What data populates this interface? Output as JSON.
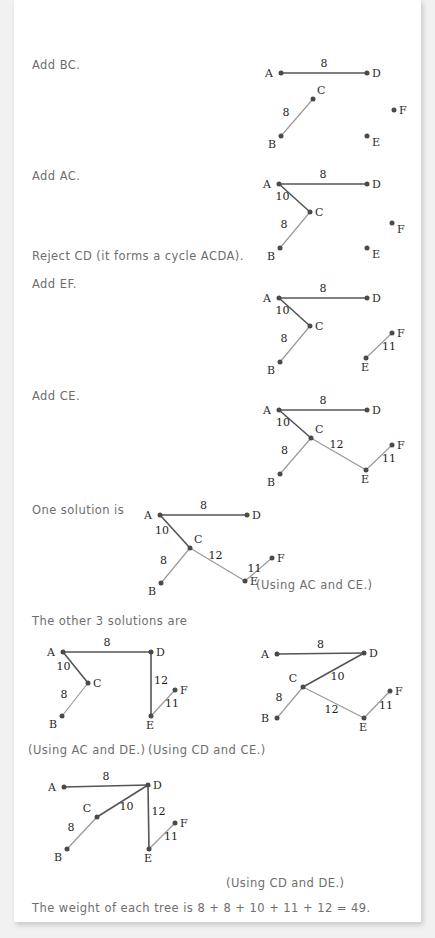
{
  "document": {
    "background_color": "#f1f1f1",
    "page_color": "#ffffff",
    "text_color": "#6e6e6e",
    "edge_dark_color": "#555555",
    "edge_light_color": "#9a9a9a",
    "node_color": "#4a4a4a"
  },
  "steps": [
    {
      "id": "step-add-bc",
      "text": "Add BC."
    },
    {
      "id": "step-add-ac",
      "text": "Add AC."
    },
    {
      "id": "step-reject-cd",
      "text": "Reject CD (it forms a cycle ACDA)."
    },
    {
      "id": "step-add-ef",
      "text": "Add EF."
    },
    {
      "id": "step-add-ce",
      "text": "Add CE."
    },
    {
      "id": "step-one-solution",
      "text": "One solution is"
    },
    {
      "id": "step-other-solutions",
      "text": "The other 3 solutions are"
    }
  ],
  "captions": [
    {
      "id": "caption-ac-ce",
      "text": "(Using AC and CE.)"
    },
    {
      "id": "caption-ac-de",
      "text": "(Using AC and DE.)"
    },
    {
      "id": "caption-cd-ce",
      "text": "(Using CD and CE.)"
    },
    {
      "id": "caption-cd-de",
      "text": "(Using CD and DE.)"
    }
  ],
  "conclusion": {
    "id": "weight-sentence",
    "text": "The weight of each tree is 8 + 8 + 10 + 11 + 12 = 49."
  },
  "chart_data": {
    "type": "diagram",
    "vertices": [
      "A",
      "B",
      "C",
      "D",
      "E",
      "F"
    ],
    "edge_weights": {
      "AD": 8,
      "BC": 8,
      "AC": 10,
      "CD": 10,
      "EF": 11,
      "CE": 12,
      "DE": 12
    },
    "total_weight": 49,
    "weight_terms": [
      8,
      8,
      10,
      11,
      12
    ],
    "figures": [
      {
        "name": "figure-add-bc",
        "caption": "Add BC.",
        "nodes": {
          "A": [
            281,
            73
          ],
          "D": [
            367,
            73
          ],
          "C": [
            313,
            99
          ],
          "B": [
            281,
            136
          ],
          "F": [
            394,
            110
          ],
          "E": [
            367,
            136
          ]
        },
        "label_pos": {
          "A": "left",
          "D": "right",
          "C": "above-right",
          "B": "below-left",
          "F": "right",
          "E": "below-right"
        },
        "edges": [
          {
            "from": "A",
            "to": "D",
            "weight": 8,
            "tone": "dark",
            "label_offset": [
              0,
              -6
            ]
          },
          {
            "from": "B",
            "to": "C",
            "weight": 8,
            "tone": "light",
            "label_offset": [
              -11,
              -2
            ]
          }
        ]
      },
      {
        "name": "figure-add-ac",
        "caption": "Add AC.",
        "nodes": {
          "A": [
            279,
            184
          ],
          "D": [
            367,
            184
          ],
          "C": [
            310,
            212
          ],
          "B": [
            280,
            248
          ],
          "F": [
            392,
            223
          ],
          "E": [
            367,
            248
          ]
        },
        "label_pos": {
          "A": "left",
          "D": "right",
          "C": "right",
          "B": "below-left",
          "F": "below-right",
          "E": "below-right"
        },
        "edges": [
          {
            "from": "A",
            "to": "D",
            "weight": 8,
            "tone": "dark",
            "label_offset": [
              0,
              -6
            ]
          },
          {
            "from": "A",
            "to": "C",
            "weight": 10,
            "tone": "dark",
            "label_offset": [
              -12,
              2
            ]
          },
          {
            "from": "B",
            "to": "C",
            "weight": 8,
            "tone": "light",
            "label_offset": [
              -11,
              -2
            ]
          }
        ]
      },
      {
        "name": "figure-add-ef",
        "caption": "Add EF.",
        "nodes": {
          "A": [
            279,
            298
          ],
          "D": [
            367,
            298
          ],
          "C": [
            310,
            326
          ],
          "B": [
            280,
            362
          ],
          "F": [
            392,
            333
          ],
          "E": [
            366,
            358
          ]
        },
        "label_pos": {
          "A": "left",
          "D": "right",
          "C": "right",
          "B": "below-left",
          "F": "right",
          "E": "below"
        },
        "edges": [
          {
            "from": "A",
            "to": "D",
            "weight": 8,
            "tone": "dark",
            "label_offset": [
              0,
              -6
            ]
          },
          {
            "from": "A",
            "to": "C",
            "weight": 10,
            "tone": "dark",
            "label_offset": [
              -12,
              2
            ]
          },
          {
            "from": "B",
            "to": "C",
            "weight": 8,
            "tone": "light",
            "label_offset": [
              -11,
              -2
            ]
          },
          {
            "from": "E",
            "to": "F",
            "weight": 11,
            "tone": "light",
            "label_offset": [
              10,
              4
            ]
          }
        ]
      },
      {
        "name": "figure-add-ce",
        "caption": "Add CE.",
        "nodes": {
          "A": [
            279,
            410
          ],
          "D": [
            367,
            410
          ],
          "C": [
            311,
            438
          ],
          "B": [
            280,
            474
          ],
          "F": [
            392,
            445
          ],
          "E": [
            366,
            470
          ]
        },
        "label_pos": {
          "A": "left",
          "D": "right",
          "C": "above-right",
          "B": "below-left",
          "F": "right",
          "E": "below"
        },
        "edges": [
          {
            "from": "A",
            "to": "D",
            "weight": 8,
            "tone": "dark",
            "label_offset": [
              0,
              -6
            ]
          },
          {
            "from": "A",
            "to": "C",
            "weight": 10,
            "tone": "dark",
            "label_offset": [
              -12,
              2
            ]
          },
          {
            "from": "B",
            "to": "C",
            "weight": 8,
            "tone": "light",
            "label_offset": [
              -11,
              -2
            ]
          },
          {
            "from": "C",
            "to": "E",
            "weight": 12,
            "tone": "light",
            "label_offset": [
              -2,
              -6
            ]
          },
          {
            "from": "E",
            "to": "F",
            "weight": 11,
            "tone": "light",
            "label_offset": [
              10,
              4
            ]
          }
        ]
      },
      {
        "name": "figure-one-solution",
        "caption": "One solution is",
        "nodes": {
          "A": [
            160,
            515
          ],
          "D": [
            247,
            515
          ],
          "C": [
            190,
            548
          ],
          "B": [
            161,
            583
          ],
          "F": [
            272,
            558
          ],
          "E": [
            245,
            581
          ]
        },
        "label_pos": {
          "A": "left",
          "D": "right",
          "C": "above-right",
          "B": "below-left",
          "F": "right",
          "E": "right"
        },
        "edges": [
          {
            "from": "A",
            "to": "D",
            "weight": 8,
            "tone": "dark",
            "label_offset": [
              0,
              -6
            ]
          },
          {
            "from": "A",
            "to": "C",
            "weight": 10,
            "tone": "dark",
            "label_offset": [
              -13,
              2
            ]
          },
          {
            "from": "B",
            "to": "C",
            "weight": 8,
            "tone": "light",
            "label_offset": [
              -12,
              -2
            ]
          },
          {
            "from": "C",
            "to": "E",
            "weight": 12,
            "tone": "light",
            "label_offset": [
              -2,
              -6
            ]
          },
          {
            "from": "E",
            "to": "F",
            "weight": 11,
            "tone": "light",
            "label_offset": [
              -4,
              2
            ]
          }
        ]
      },
      {
        "name": "figure-ac-de",
        "caption": "(Using AC and DE.)",
        "nodes": {
          "A": [
            63,
            652
          ],
          "D": [
            151,
            652
          ],
          "C": [
            88,
            683
          ],
          "B": [
            62,
            716
          ],
          "F": [
            175,
            690
          ],
          "E": [
            151,
            716
          ]
        },
        "label_pos": {
          "A": "left",
          "D": "right",
          "C": "right",
          "B": "below-left",
          "F": "right",
          "E": "below"
        },
        "edges": [
          {
            "from": "A",
            "to": "D",
            "weight": 8,
            "tone": "dark",
            "label_offset": [
              0,
              -6
            ]
          },
          {
            "from": "A",
            "to": "C",
            "weight": 10,
            "tone": "dark",
            "label_offset": [
              -12,
              2
            ]
          },
          {
            "from": "B",
            "to": "C",
            "weight": 8,
            "tone": "light",
            "label_offset": [
              -11,
              -2
            ]
          },
          {
            "from": "D",
            "to": "E",
            "weight": 12,
            "tone": "dark",
            "label_offset": [
              10,
              0
            ]
          },
          {
            "from": "E",
            "to": "F",
            "weight": 11,
            "tone": "light",
            "label_offset": [
              9,
              4
            ]
          }
        ]
      },
      {
        "name": "figure-cd-ce",
        "caption": "(Using CD and CE.)",
        "nodes": {
          "A": [
            277,
            654
          ],
          "D": [
            364,
            653
          ],
          "C": [
            303,
            687
          ],
          "B": [
            277,
            718
          ],
          "F": [
            390,
            691
          ],
          "E": [
            364,
            718
          ]
        },
        "label_pos": {
          "A": "left",
          "D": "right",
          "C": "above-left",
          "B": "left",
          "F": "right",
          "E": "below"
        },
        "edges": [
          {
            "from": "A",
            "to": "D",
            "weight": 8,
            "tone": "dark",
            "label_offset": [
              0,
              -6
            ]
          },
          {
            "from": "C",
            "to": "D",
            "weight": 10,
            "tone": "dark",
            "label_offset": [
              4,
              10
            ]
          },
          {
            "from": "B",
            "to": "C",
            "weight": 8,
            "tone": "light",
            "label_offset": [
              -11,
              -2
            ]
          },
          {
            "from": "C",
            "to": "E",
            "weight": 12,
            "tone": "light",
            "label_offset": [
              -2,
              10
            ]
          },
          {
            "from": "E",
            "to": "F",
            "weight": 11,
            "tone": "light",
            "label_offset": [
              9,
              4
            ]
          }
        ]
      },
      {
        "name": "figure-cd-de",
        "caption": "(Using CD and DE.)",
        "nodes": {
          "A": [
            64,
            787
          ],
          "D": [
            148,
            785
          ],
          "C": [
            97,
            817
          ],
          "B": [
            67,
            849
          ],
          "F": [
            175,
            823
          ],
          "E": [
            149,
            849
          ]
        },
        "label_pos": {
          "A": "left",
          "D": "right",
          "C": "above-left",
          "B": "below-left",
          "F": "right",
          "E": "below"
        },
        "edges": [
          {
            "from": "A",
            "to": "D",
            "weight": 8,
            "tone": "dark",
            "label_offset": [
              0,
              -6
            ]
          },
          {
            "from": "C",
            "to": "D",
            "weight": 10,
            "tone": "dark",
            "label_offset": [
              4,
              9
            ]
          },
          {
            "from": "B",
            "to": "C",
            "weight": 8,
            "tone": "light",
            "label_offset": [
              -11,
              -2
            ]
          },
          {
            "from": "D",
            "to": "E",
            "weight": 12,
            "tone": "dark",
            "label_offset": [
              10,
              -2
            ]
          },
          {
            "from": "E",
            "to": "F",
            "weight": 11,
            "tone": "light",
            "label_offset": [
              9,
              4
            ]
          }
        ]
      }
    ]
  },
  "text_positions": {
    "step-add-bc": [
      32,
      58
    ],
    "step-add-ac": [
      32,
      169
    ],
    "step-reject-cd": [
      32,
      249
    ],
    "step-add-ef": [
      32,
      277
    ],
    "step-add-ce": [
      32,
      389
    ],
    "step-one-solution": [
      32,
      503
    ],
    "step-other-solutions": [
      32,
      614
    ],
    "caption-ac-ce": [
      256,
      578
    ],
    "caption-ac-de": [
      28,
      743
    ],
    "caption-cd-ce": [
      148,
      743
    ],
    "caption-cd-de": [
      226,
      876
    ],
    "weight-sentence": [
      32,
      901
    ]
  }
}
